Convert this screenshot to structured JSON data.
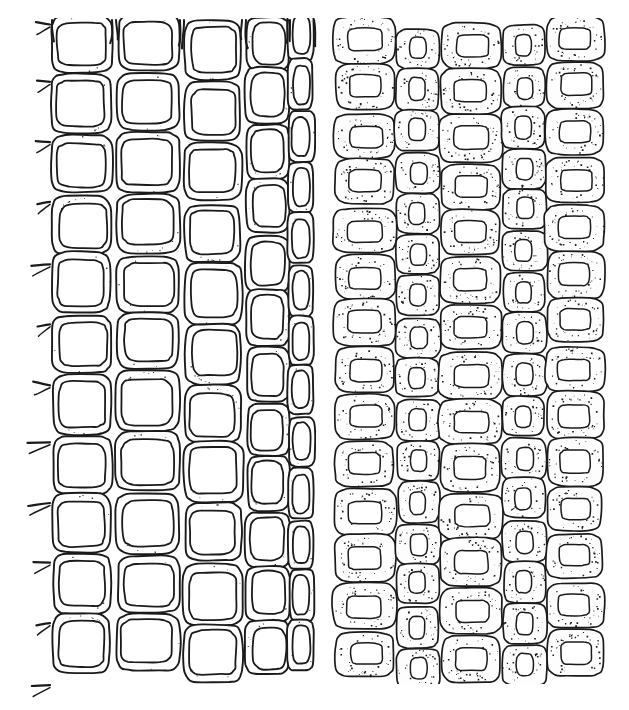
{
  "figure": {
    "kind": "scientific-line-illustration",
    "caption_text": "",
    "width": 629,
    "height": 710,
    "background_color": "#ffffff",
    "ink_color": "#1a1a1a",
    "stipple_color": "#111111",
    "has_labels": false,
    "has_axes": false,
    "has_legend": false,
    "has_scale_bar": false
  },
  "panels": [
    {
      "id": "left-panel",
      "name": "thin-walled-large-lumen-tissue",
      "description": "Network of large thin-walled cells with wide clear lumens separated by narrow lightly-stippled walls; short wall stubs project from the left margin.",
      "bounds": {
        "x": 34,
        "y": 22,
        "width": 276,
        "height": 662
      },
      "wall_style": "narrow lightly stippled band with dark outline",
      "lumen_fill": "#ffffff",
      "stipple_density": 0.22,
      "stroke_width": 1.9,
      "seed": 20147,
      "left_margin_stubs": true,
      "columns": [
        {
          "index": 0,
          "x": 52,
          "width": 60,
          "rows": 11,
          "lumen_shape": "rounded-square",
          "row_jitter": 4
        },
        {
          "index": 1,
          "x": 116,
          "width": 64,
          "rows": 11,
          "lumen_shape": "rounded-square",
          "row_jitter": 5
        },
        {
          "index": 2,
          "x": 184,
          "width": 58,
          "rows": 11,
          "lumen_shape": "rounded-square",
          "row_jitter": 4
        },
        {
          "index": 3,
          "x": 246,
          "width": 44,
          "rows": 12,
          "lumen_shape": "rounded-oval",
          "row_jitter": 5
        },
        {
          "index": 4,
          "x": 288,
          "width": 26,
          "rows": 13,
          "lumen_shape": "narrow-oval",
          "row_jitter": 4
        }
      ]
    },
    {
      "id": "right-panel",
      "name": "thick-walled-small-lumen-tissue",
      "description": "Densely packed cells with very thick heavily stippled walls and small central lumens; alternating wide and narrow columns.",
      "bounds": {
        "x": 330,
        "y": 22,
        "width": 272,
        "height": 660
      },
      "wall_style": "thick heavily stippled wall with dark outline",
      "lumen_fill": "#ffffff",
      "stipple_density": 0.72,
      "stroke_width": 1.7,
      "seed": 88231,
      "left_margin_stubs": false,
      "columns": [
        {
          "index": 0,
          "x": 334,
          "width": 62,
          "rows": 14,
          "lumen_shape": "rounded-rect",
          "row_jitter": 3
        },
        {
          "index": 1,
          "x": 396,
          "width": 44,
          "rows": 16,
          "lumen_shape": "vertical-oval",
          "row_jitter": 3
        },
        {
          "index": 2,
          "x": 440,
          "width": 62,
          "rows": 14,
          "lumen_shape": "rounded-rect",
          "row_jitter": 3
        },
        {
          "index": 3,
          "x": 502,
          "width": 44,
          "rows": 16,
          "lumen_shape": "vertical-oval",
          "row_jitter": 3
        },
        {
          "index": 4,
          "x": 546,
          "width": 58,
          "rows": 14,
          "lumen_shape": "rounded-rect",
          "row_jitter": 3
        }
      ]
    }
  ],
  "gap": {
    "between_panels_x_start": 310,
    "between_panels_x_end": 330
  }
}
